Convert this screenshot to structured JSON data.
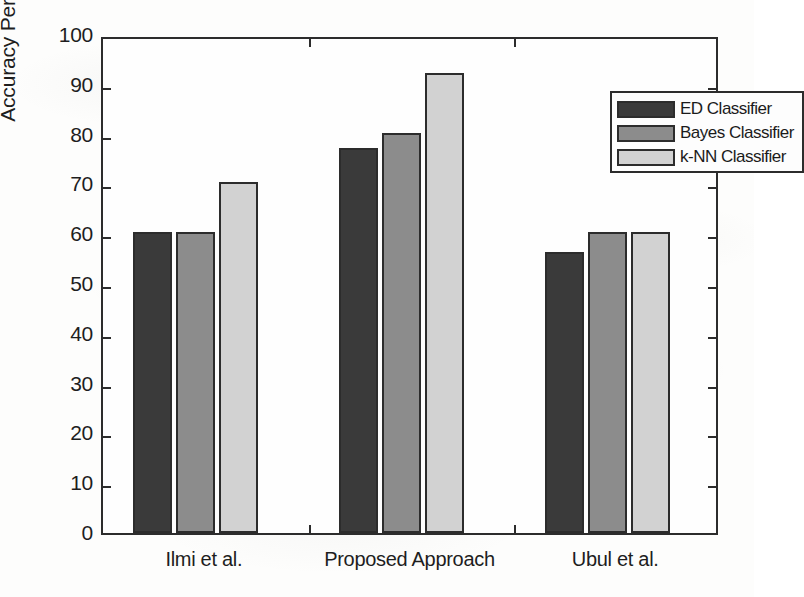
{
  "chart_data": {
    "type": "bar",
    "title": "",
    "xlabel": "",
    "ylabel": "Accuracy Percentage (%)",
    "ylim": [
      0,
      100
    ],
    "ytick_step": 10,
    "yticks": [
      0,
      10,
      20,
      30,
      40,
      50,
      60,
      70,
      80,
      90,
      100
    ],
    "ytick_labels": [
      "0",
      "10",
      "20",
      "30",
      "40",
      "50",
      "60",
      "70",
      "80",
      "90",
      "100"
    ],
    "grid": false,
    "legend_position": "top-right",
    "categories": [
      "Ilmi et al.",
      "Proposed Approach",
      "Ubul et al."
    ],
    "series": [
      {
        "name": "ED Classifier",
        "values": [
          60,
          77,
          56
        ],
        "color": "#3a3a3a"
      },
      {
        "name": "Bayes Classifier",
        "values": [
          60,
          80,
          60
        ],
        "color": "#8c8c8c"
      },
      {
        "name": "k-NN Classifier",
        "values": [
          70,
          92,
          60
        ],
        "color": "#d2d2d2"
      }
    ]
  },
  "legend": {
    "entries": [
      {
        "label": "ED Classifier",
        "color": "#3a3a3a"
      },
      {
        "label": "Bayes Classifier",
        "color": "#8c8c8c"
      },
      {
        "label": "k-NN Classifier",
        "color": "#d2d2d2"
      }
    ]
  },
  "axis": {
    "edge_color": "#2c2c2c"
  }
}
